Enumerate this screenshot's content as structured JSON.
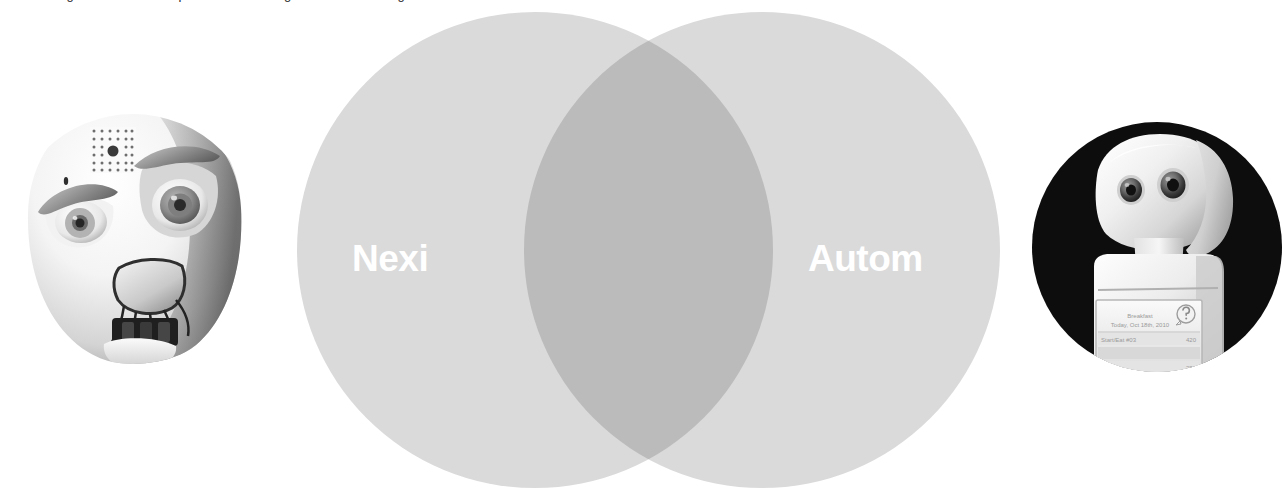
{
  "page": {
    "clipped_heading": "can be designed as a sociable partner that leverages our social intelligence",
    "background_color": "#ffffff"
  },
  "venn": {
    "type": "venn-2-set",
    "left_circle": {
      "label": "Nexi",
      "fill": "#dadada",
      "center_x": 535,
      "center_y": 250,
      "radius": 238
    },
    "right_circle": {
      "label": "Autom",
      "fill": "#dadada",
      "center_x": 762,
      "center_y": 250,
      "radius": 238
    },
    "intersection": {
      "fill": "#bbbbbb",
      "label": ""
    },
    "label_color": "#ffffff"
  },
  "images": {
    "left": {
      "name": "nexi-robot-photo",
      "caption": "Nexi robot head",
      "shape": "circle",
      "alt": "Expressive white robot face with large eyes, movable eyebrows, sensor patch on forehead and mechanical jaw"
    },
    "right": {
      "name": "autom-robot-photo",
      "caption": "Autom robot",
      "shape": "circle",
      "alt": "White desktop social robot with two camera eyes and a touchscreen torso",
      "screen": {
        "title": "Breakfast",
        "date": "Today, Oct 18th, 2010",
        "row1_label": "Start/Eat #03",
        "row1_value": "420",
        "row2_value": "280",
        "help_icon": "?"
      }
    }
  }
}
